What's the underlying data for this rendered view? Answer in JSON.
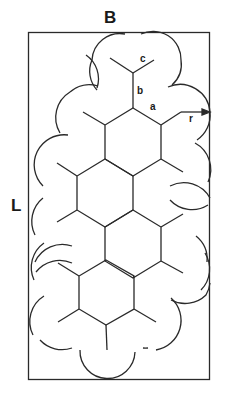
{
  "figure": {
    "labels": {
      "width_label": "B",
      "length_label": "L",
      "spoke_c": "c",
      "spoke_b": "b",
      "side_a": "a",
      "radius_r": "r"
    },
    "colors": {
      "stroke": "#2a2a2a",
      "background": "#ffffff"
    },
    "frame": {
      "x": 28,
      "y": 32,
      "width": 182,
      "height": 348
    },
    "hexagon_count": 4
  }
}
